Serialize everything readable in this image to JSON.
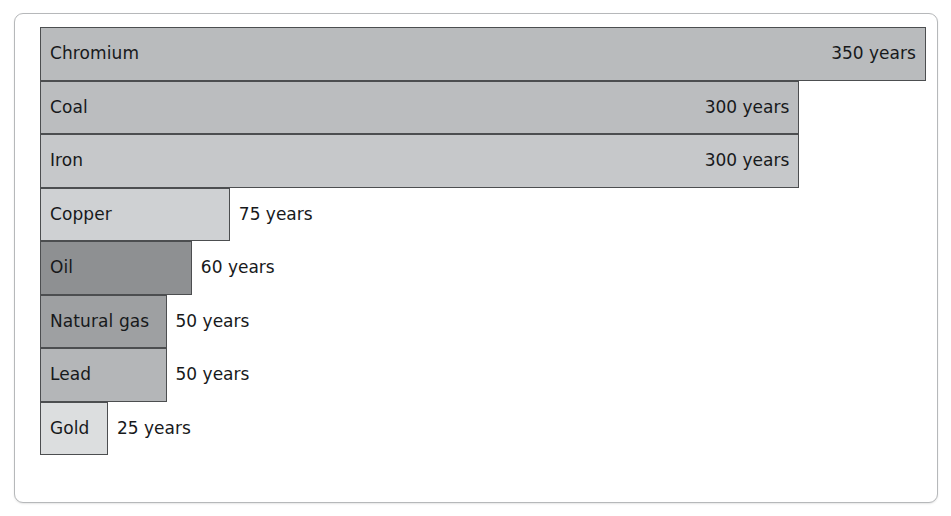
{
  "chart_data": {
    "type": "bar",
    "orientation": "horizontal",
    "title": "",
    "subtitle": "",
    "xlabel": "",
    "ylabel": "",
    "unit": "years",
    "xlim": [
      0,
      350
    ],
    "grid": false,
    "legend": null,
    "categories": [
      "Chromium",
      "Coal",
      "Iron",
      "Copper",
      "Oil",
      "Natural gas",
      "Lead",
      "Gold"
    ],
    "values": [
      350,
      300,
      300,
      75,
      60,
      50,
      50,
      25
    ],
    "value_labels": [
      "350 years",
      "300 years",
      "300 years",
      "75 years",
      "60 years",
      "50 years",
      "50 years",
      "25 years"
    ],
    "label_placement": [
      "inside",
      "inside",
      "inside",
      "outside",
      "outside",
      "outside",
      "outside",
      "outside"
    ],
    "bar_colors": [
      "#b9bbbd",
      "#bbbdbf",
      "#c6c8ca",
      "#cfd1d3",
      "#8e9092",
      "#9ea0a2",
      "#b4b6b8",
      "#dcdedf"
    ],
    "bar_border_color": "#4c4e50",
    "frame_border_color": "#b6b8ba",
    "background_color": "#ffffff",
    "text_color": "#17191b"
  },
  "bars": [
    {
      "name": "Chromium",
      "value": 350,
      "label": "Chromium",
      "value_label": "350 years",
      "placement": "inside",
      "color": "#b9bbbd"
    },
    {
      "name": "Coal",
      "value": 300,
      "label": "Coal",
      "value_label": "300 years",
      "placement": "inside",
      "color": "#bbbdbf"
    },
    {
      "name": "Iron",
      "value": 300,
      "label": "Iron",
      "value_label": "300 years",
      "placement": "inside",
      "color": "#c6c8ca"
    },
    {
      "name": "Copper",
      "value": 75,
      "label": "Copper",
      "value_label": "75 years",
      "placement": "outside",
      "color": "#cfd1d3"
    },
    {
      "name": "Oil",
      "value": 60,
      "label": "Oil",
      "value_label": "60 years",
      "placement": "outside",
      "color": "#8e9092"
    },
    {
      "name": "Natural gas",
      "value": 50,
      "label": "Natural gas",
      "value_label": "50 years",
      "placement": "outside",
      "color": "#9ea0a2"
    },
    {
      "name": "Lead",
      "value": 50,
      "label": "Lead",
      "value_label": "50 years",
      "placement": "outside",
      "color": "#b4b6b8"
    },
    {
      "name": "Gold",
      "value": 25,
      "label": "Gold",
      "value_label": "25 years",
      "placement": "outside",
      "color": "#dcdedf"
    }
  ],
  "scale": {
    "px_per_year": 2.531,
    "min_bar_px": 68
  }
}
